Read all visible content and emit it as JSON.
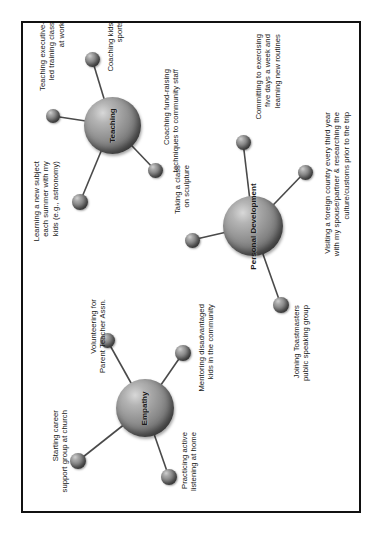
{
  "page": {
    "orientation": "rotated-90-ccw",
    "background": "#ffffff",
    "frame_color": "#111111",
    "node_color": "#7d7d7d"
  },
  "clusters": [
    {
      "id": "teaching",
      "hub_label": "Teaching",
      "satellites": [
        {
          "id": "teaching-exec",
          "label": "Teaching executive-\nled training class\nat work"
        },
        {
          "id": "coaching-sports",
          "label": "Coaching kids'\nsports"
        },
        {
          "id": "coaching-fundraising",
          "label": "Coaching fund-raising\ntechniques to community staff"
        },
        {
          "id": "learning-subject",
          "label": "Learning a new subject\neach summer with my\nkids (e.g., astronomy)"
        }
      ]
    },
    {
      "id": "personal-development",
      "hub_label": "Personal\nDevelopment",
      "satellites": [
        {
          "id": "exercising",
          "label": "Committing to exercising\nfive days a week and\nlearning new routines"
        },
        {
          "id": "sculpture-class",
          "label": "Taking a class\non sculpture"
        },
        {
          "id": "toastmasters",
          "label": "Joining Toastmasters\npublic speaking group"
        },
        {
          "id": "foreign-country",
          "label": "Visiting a foreign country every third year\nwith my spouse/partner & researching the\nculture/customs prior to the trip"
        }
      ]
    },
    {
      "id": "empathy",
      "hub_label": "Empathy",
      "satellites": [
        {
          "id": "volunteering-pta",
          "label": "Volunteering for\nParent Teacher Assn."
        },
        {
          "id": "mentoring",
          "label": "Mentoring disadvantaged\nkids in the community"
        },
        {
          "id": "career-support",
          "label": "Starting career\nsupport group at church"
        },
        {
          "id": "active-listening",
          "label": "Practicing active\nlistening at home"
        }
      ]
    }
  ]
}
